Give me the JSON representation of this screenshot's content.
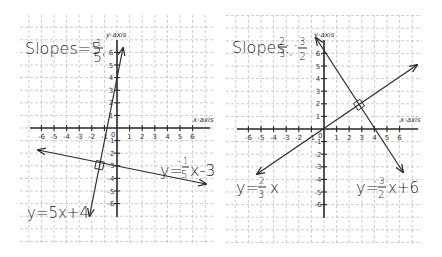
{
  "panels": [
    {
      "id": "left",
      "title": "Slopes = 5, -1/5",
      "title_text": "Slopes=5,",
      "title_frac": {
        "sign": "-",
        "num": "1",
        "den": "5"
      },
      "axis_labels": {
        "x": "x-axis",
        "y": "y-axis"
      },
      "origin_label": "0",
      "x_ticks": [
        "-6",
        "-5",
        "-4",
        "-3",
        "-2",
        "-1",
        "1",
        "2",
        "3",
        "4",
        "5",
        "6"
      ],
      "y_ticks_pos": [
        "1",
        "2",
        "3",
        "4",
        "5",
        "6"
      ],
      "y_ticks_neg": [
        "-1",
        "-2",
        "-3",
        "-4",
        "-5",
        "-6"
      ],
      "equations": [
        {
          "label": "y=5x+4",
          "slope": 5,
          "intercept": 4
        },
        {
          "label": "y=-1/5x-3",
          "prefix": "y=",
          "frac": {
            "sign": "-",
            "num": "1",
            "den": "5"
          },
          "suffix": "x-3",
          "slope": -0.2,
          "intercept": -3
        }
      ],
      "perpendicular_marker": true
    },
    {
      "id": "right",
      "title": "Slopes = 2/3, -3/2",
      "title_text": "Slopes:",
      "title_frac1": {
        "num": "2",
        "den": "3"
      },
      "title_frac2": {
        "sign": "-",
        "num": "3",
        "den": "2"
      },
      "axis_labels": {
        "x": "x-axis",
        "y": "y-axis"
      },
      "origin_label": "0",
      "x_ticks": [
        "-6",
        "-5",
        "-4",
        "-3",
        "-2",
        "-1",
        "1",
        "2",
        "3",
        "4",
        "5",
        "6"
      ],
      "y_ticks_pos": [
        "1",
        "2",
        "3",
        "4",
        "5",
        "6"
      ],
      "y_ticks_neg": [
        "-1",
        "-2",
        "-3",
        "-4",
        "-5",
        "-6"
      ],
      "equations": [
        {
          "label": "y=2/3x",
          "prefix": "y=",
          "frac": {
            "num": "2",
            "den": "3"
          },
          "suffix": "x",
          "slope": 0.6667,
          "intercept": 0
        },
        {
          "label": "y=-3/2x+6",
          "prefix": "y=",
          "frac": {
            "sign": "-",
            "num": "3",
            "den": "2"
          },
          "suffix": "x+6",
          "slope": -1.5,
          "intercept": 6
        }
      ],
      "perpendicular_marker": true
    }
  ],
  "comma": ","
}
